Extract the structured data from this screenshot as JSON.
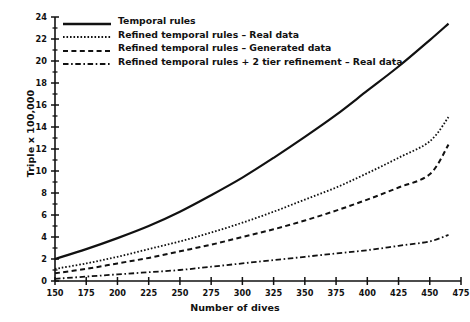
{
  "chart_data": {
    "type": "line",
    "title": "",
    "xlabel": "Number of dives",
    "ylabel": "Triple x 100,000",
    "xlim": [
      150,
      475
    ],
    "ylim": [
      0,
      24
    ],
    "xticks": [
      150,
      175,
      200,
      225,
      250,
      275,
      300,
      325,
      350,
      375,
      400,
      425,
      450,
      475
    ],
    "yticks": [
      0,
      2,
      4,
      6,
      8,
      10,
      12,
      14,
      16,
      18,
      20,
      22,
      24
    ],
    "yminorticks": [
      1,
      3,
      5,
      7,
      9,
      11,
      13,
      15,
      17,
      19,
      21,
      23
    ],
    "grid": false,
    "legend_position": "top-left",
    "x": [
      150,
      175,
      200,
      225,
      250,
      275,
      300,
      325,
      350,
      375,
      400,
      425,
      450,
      465
    ],
    "series": [
      {
        "name": "Temporal rules",
        "style": "solid",
        "values": [
          2.0,
          2.9,
          3.9,
          5.0,
          6.3,
          7.8,
          9.4,
          11.2,
          13.1,
          15.1,
          17.3,
          19.5,
          21.9,
          23.4
        ]
      },
      {
        "name": "Refined temporal rules – Real data",
        "style": "dotted",
        "values": [
          1.1,
          1.6,
          2.2,
          2.9,
          3.6,
          4.4,
          5.3,
          6.3,
          7.4,
          8.5,
          9.8,
          11.2,
          12.7,
          14.9
        ]
      },
      {
        "name": "Refined temporal rules – Generated data",
        "style": "dashed",
        "values": [
          0.7,
          1.1,
          1.6,
          2.1,
          2.7,
          3.3,
          4.0,
          4.7,
          5.5,
          6.4,
          7.4,
          8.5,
          9.7,
          12.4
        ]
      },
      {
        "name": "Refined temporal rules + 2 tier refinement – Real data",
        "style": "dashdot",
        "values": [
          0.2,
          0.4,
          0.6,
          0.8,
          1.0,
          1.3,
          1.6,
          1.9,
          2.2,
          2.5,
          2.8,
          3.2,
          3.6,
          4.2
        ]
      }
    ]
  },
  "axes": {
    "xlabel": "Number of dives",
    "ylabel": "Triple x 100,000",
    "xtick_labels": [
      "150",
      "175",
      "200",
      "225",
      "250",
      "275",
      "300",
      "325",
      "350",
      "375",
      "400",
      "425",
      "450",
      "475"
    ],
    "ytick_labels": [
      "0",
      "2",
      "4",
      "6",
      "8",
      "10",
      "12",
      "14",
      "16",
      "18",
      "20",
      "22",
      "24"
    ]
  },
  "legend": {
    "items": [
      {
        "label": "Temporal rules",
        "style": "solid"
      },
      {
        "label": "Refined temporal rules – Real data",
        "style": "dotted"
      },
      {
        "label": "Refined temporal rules – Generated data",
        "style": "dashed"
      },
      {
        "label": "Refined temporal rules + 2 tier refinement – Real data",
        "style": "dashdot"
      }
    ]
  },
  "colors": {
    "ink": "#111111",
    "background": "#ffffff"
  }
}
